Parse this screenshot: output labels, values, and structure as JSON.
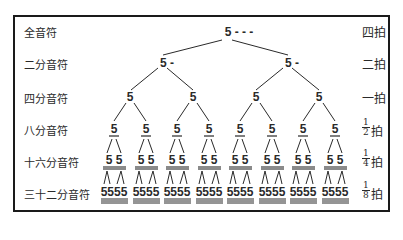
{
  "diagram": {
    "title": "",
    "rows": [
      {
        "name": "全音符",
        "beat": "四拍",
        "beat_fraction": null
      },
      {
        "name": "二分音符",
        "beat": "二拍",
        "beat_fraction": null
      },
      {
        "name": "四分音符",
        "beat": "一拍",
        "beat_fraction": null
      },
      {
        "name": "八分音符",
        "beat": "拍",
        "beat_fraction": {
          "num": "1",
          "den": "2"
        }
      },
      {
        "name": "十六分音符",
        "beat": "拍",
        "beat_fraction": {
          "num": "1",
          "den": "4"
        }
      },
      {
        "name": "三十二分音符",
        "beat": "拍",
        "beat_fraction": {
          "num": "1",
          "den": "8"
        }
      }
    ],
    "notes": {
      "whole": "5 - - -",
      "half": "5 -",
      "quarter": "5",
      "eighth": "5",
      "sixteenth": "5 5",
      "thirty_second": "5555"
    },
    "counts": {
      "whole": 1,
      "half": 2,
      "quarter": 4,
      "eighth": 8,
      "sixteenth_groups": 8,
      "thirty_second_groups": 8
    }
  }
}
